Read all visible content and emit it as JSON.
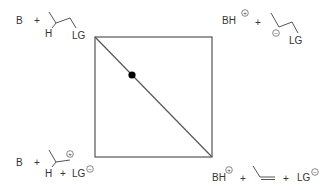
{
  "diagram": {
    "type": "More O'Ferrall-Jencks plot (elimination reaction)",
    "colors": {
      "line": "#555555",
      "text": "#333333",
      "dot": "#000000",
      "background": "#ffffff"
    },
    "corners": {
      "top_left": {
        "label": "reactants",
        "base": "B",
        "plus1": "+",
        "h": "H",
        "lg": "LG"
      },
      "top_right": {
        "label": "carbanion intermediate",
        "base": "BH",
        "base_charge": "+",
        "plus1": "+",
        "carbanion_charge": "−",
        "lg": "LG"
      },
      "bottom_left": {
        "label": "carbocation intermediate",
        "base": "B",
        "plus1": "+",
        "cation_charge": "+",
        "h": "H",
        "plus2": "+",
        "lg": "LG",
        "lg_charge": "−"
      },
      "bottom_right": {
        "label": "products",
        "base": "BH",
        "base_charge": "+",
        "plus1": "+",
        "plus2": "+",
        "lg": "LG",
        "lg_charge": "−"
      }
    },
    "square": {
      "x": 95,
      "y": 37,
      "width": 117,
      "height": 120
    },
    "diagonal": {
      "from": "top-left",
      "to": "bottom-right"
    },
    "transition_state_dot": {
      "x": 132,
      "y": 75
    }
  }
}
